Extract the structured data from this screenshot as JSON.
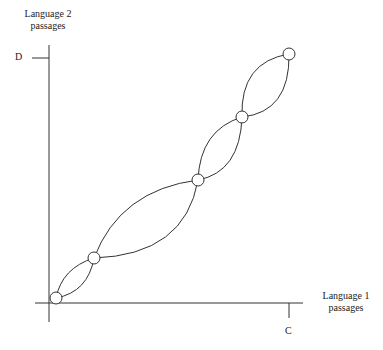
{
  "y_axis": {
    "label_line1": "Language 2",
    "label_line2": "passages",
    "tick_label": "D"
  },
  "x_axis": {
    "label_line1": "Language 1",
    "label_line2": "passages",
    "tick_label": "C"
  },
  "nodes": [
    {
      "x": 56,
      "y": 298
    },
    {
      "x": 94,
      "y": 258
    },
    {
      "x": 198,
      "y": 180
    },
    {
      "x": 242,
      "y": 117
    },
    {
      "x": 289,
      "y": 54
    }
  ]
}
